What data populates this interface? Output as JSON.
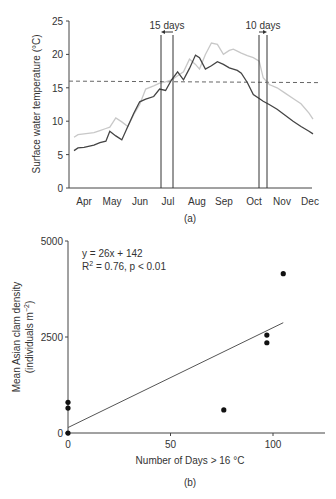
{
  "chart_data": [
    {
      "type": "line",
      "panel_label": "(a)",
      "title": "",
      "xlabel": "",
      "ylabel": "Surface water temperature (°C)",
      "ylim": [
        0,
        25
      ],
      "yticks": [
        0,
        5,
        10,
        15,
        20,
        25
      ],
      "xlim": [
        0,
        8.7
      ],
      "xtick_labels": [
        "Apr",
        "May",
        "Jun",
        "Jul",
        "Aug",
        "Sep",
        "Oct",
        "Nov",
        "Dec"
      ],
      "threshold": {
        "value": 16,
        "style": "dashed"
      },
      "annotations": [
        {
          "text": "15 days",
          "lines_x": [
            5.65,
            6.1
          ],
          "arrow": "left"
        },
        {
          "text": "10 days",
          "lines_x": [
            9.15,
            9.45
          ],
          "arrow": "right"
        }
      ],
      "series": [
        {
          "name": "upper",
          "color": "#c8c8c8",
          "x": [
            0,
            0.2,
            0.5,
            1.0,
            1.3,
            1.6,
            1.8,
            2.1,
            2.4,
            2.7,
            3.0,
            3.3,
            3.6,
            4.0,
            4.3,
            4.6,
            4.9,
            5.2,
            5.5,
            5.8,
            6.1,
            6.3,
            6.6,
            6.9,
            7.2,
            7.5,
            7.8,
            8.0,
            8.2,
            8.4,
            8.7,
            9.0,
            9.3,
            9.5,
            9.8,
            10.2,
            10.6,
            11.0,
            11.4,
            11.8,
            12.0
          ],
          "values": [
            7.6,
            8.0,
            8.1,
            8.3,
            8.6,
            8.9,
            9.1,
            10.5,
            9.9,
            9.2,
            11.0,
            12.5,
            14.8,
            15.3,
            15.7,
            15.9,
            16.2,
            16.8,
            17.4,
            19.3,
            18.5,
            17.8,
            20.0,
            21.7,
            21.5,
            20.0,
            20.6,
            20.8,
            20.5,
            20.2,
            19.8,
            19.5,
            19.0,
            16.5,
            15.5,
            15.0,
            14.2,
            13.4,
            12.6,
            11.2,
            10.3
          ]
        },
        {
          "name": "lower",
          "color": "#444444",
          "x": [
            0,
            0.2,
            0.5,
            1.0,
            1.3,
            1.6,
            1.8,
            2.1,
            2.4,
            2.7,
            3.0,
            3.3,
            3.6,
            4.0,
            4.3,
            4.6,
            4.9,
            5.2,
            5.5,
            5.8,
            6.1,
            6.3,
            6.6,
            6.9,
            7.2,
            7.5,
            7.8,
            8.0,
            8.2,
            8.4,
            8.7,
            9.0,
            9.3,
            9.5,
            9.8,
            10.2,
            10.6,
            11.0,
            11.4,
            11.8,
            12.0
          ],
          "values": [
            5.6,
            6.0,
            6.1,
            6.4,
            6.8,
            7.0,
            8.5,
            7.8,
            7.2,
            9.2,
            11.2,
            12.9,
            13.3,
            13.7,
            14.8,
            14.6,
            16.2,
            17.4,
            16.2,
            17.9,
            19.9,
            19.5,
            17.8,
            18.3,
            18.9,
            18.5,
            18.0,
            17.8,
            17.6,
            17.2,
            15.8,
            14.0,
            13.4,
            13.0,
            12.5,
            11.8,
            10.9,
            10.0,
            9.2,
            8.5,
            8.1
          ]
        }
      ]
    },
    {
      "type": "scatter",
      "panel_label": "(b)",
      "title": "",
      "xlabel": "Number of Days > 16 °C",
      "ylabel_line1": "Mean Asian clam density",
      "ylabel_line2": "(individuals m",
      "ylabel_sup": "−2",
      "ylabel_close": ")",
      "xlim": [
        0,
        125
      ],
      "ylim": [
        0,
        5000
      ],
      "xticks": [
        0,
        50,
        100
      ],
      "yticks": [
        0,
        2500,
        5000
      ],
      "equation": "y = 26x + 142",
      "r2_prefix": "R",
      "r2_sup": "2",
      "r2_suffix": " = 0.76, p < 0.01",
      "fit": {
        "slope": 26,
        "intercept": 142,
        "x_range": [
          0,
          105
        ]
      },
      "points": [
        {
          "x": 0,
          "y": 0
        },
        {
          "x": 0,
          "y": 650
        },
        {
          "x": 0,
          "y": 800
        },
        {
          "x": 76,
          "y": 600
        },
        {
          "x": 97,
          "y": 2350
        },
        {
          "x": 97,
          "y": 2550
        },
        {
          "x": 105,
          "y": 4150
        }
      ]
    }
  ]
}
